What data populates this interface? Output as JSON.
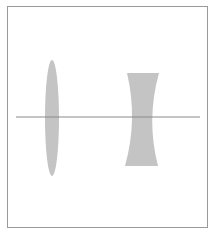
{
  "diagram": {
    "type": "optics-lens-diagram",
    "frame": {
      "x": 7,
      "y": 6,
      "width": 201,
      "height": 222,
      "border_color": "#9a9a9a"
    },
    "optical_axis": {
      "x1": 16,
      "y1": 117,
      "x2": 200,
      "y2": 117,
      "color": "#8a8a8a"
    },
    "lenses": [
      {
        "name": "convex-lens",
        "kind": "converging",
        "cx": 52,
        "cy": 118,
        "rx": 7,
        "ry": 58,
        "fill": "#c4c4c4"
      },
      {
        "name": "concave-lens",
        "kind": "diverging",
        "top_y": 73,
        "bottom_y": 166,
        "top_left_x": 127,
        "top_right_x": 159,
        "bottom_left_x": 125,
        "bottom_right_x": 158,
        "waist_left_x": 136,
        "waist_right_x": 148,
        "fill": "#c4c4c4"
      }
    ]
  }
}
